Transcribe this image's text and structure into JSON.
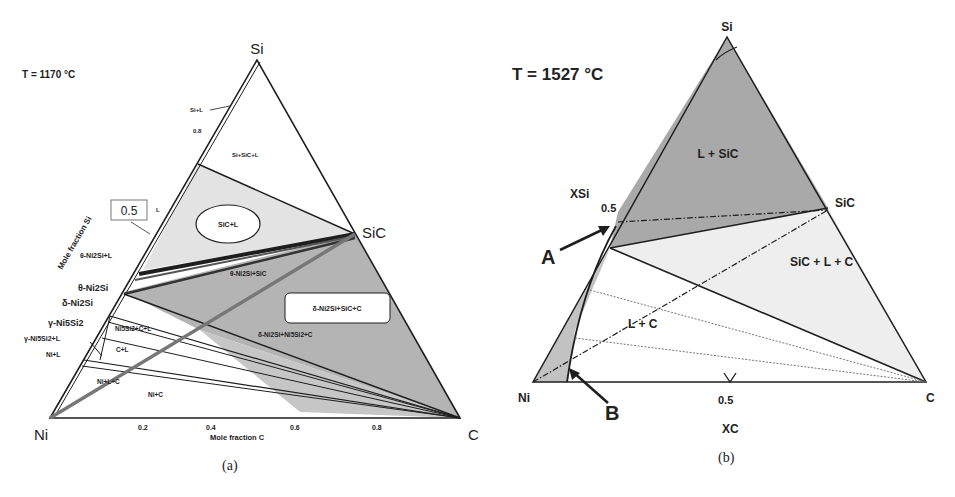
{
  "panel_a": {
    "temperature": "T = 1170 °C",
    "vertex_si": "Si",
    "vertex_ni": "Ni",
    "vertex_c": "C",
    "vertex_sic": "SiC",
    "axis_si_label": "Mole fraction Si",
    "axis_c_label": "Mole fraction C",
    "tick_si_08": "0.8",
    "boxed_05": "0.5",
    "ticks_c": [
      "0.2",
      "0.4",
      "0.6",
      "0.8"
    ],
    "regions": {
      "si_l": "Si+L",
      "si_sic_l": "Si+SiC+L",
      "l": "L",
      "sic_l": "SiC+L",
      "theta_l": "θ-Ni2Si+L",
      "theta_sic": "θ-Ni2Si+SiC",
      "theta": "θ-Ni2Si",
      "delta": "δ-Ni2Si",
      "gamma": "γ-Ni5Si2",
      "gamma_l": "γ-Ni5Si2+L",
      "ni5si2_c_l": "Ni5Si2+C+L",
      "c_l": "C+L",
      "ni_l": "Ni+L",
      "ni_l_c": "Ni+L+C",
      "ni_c": "Ni+C",
      "delta_sic_c": "δ-Ni2Si+SiC+C",
      "delta_ni5si2_c": "δ-Ni2Si+Ni5Si2+C"
    },
    "caption": "(a)"
  },
  "panel_b": {
    "temperature": "T = 1527 °C",
    "vertex_si": "Si",
    "vertex_ni": "Ni",
    "vertex_c": "C",
    "vertex_sic": "SiC",
    "axis_si_label": "XSi",
    "axis_c_label": "XC",
    "tick_si_05": "0.5",
    "tick_c_05": "0.5",
    "regions": {
      "l_sic": "L + SiC",
      "sic_l_c": "SiC + L + C",
      "l_c": "L + C"
    },
    "marker_a": "A",
    "marker_b": "B",
    "caption": "(b)"
  },
  "colors": {
    "line": "#1e1e1e",
    "dark_fill": "#a9a9a9",
    "light_fill": "#e6e6e6",
    "mid_fill": "#bdbdbd",
    "gray_line": "#7a7a7a"
  }
}
